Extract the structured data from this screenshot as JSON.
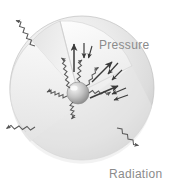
{
  "figure": {
    "name": "stellar-equilibrium-diagram",
    "width": 174,
    "height": 189,
    "background_color": "#ffffff"
  },
  "labels": {
    "pressure": "Pressure",
    "radiation": "Radiation",
    "text_color": "#8b8b8b"
  },
  "star": {
    "body_name": "star-sphere",
    "center": {
      "x": 82,
      "y": 88
    },
    "radius": 72,
    "surface_color_light": "#f2f2f2",
    "surface_color_mid": "#dcdcdc",
    "surface_color_dark": "#c8c8c8",
    "cutaway_name": "cutaway-wedge",
    "cutaway_color": "#fbfbfb",
    "core_name": "stellar-core",
    "core_center": {
      "x": 78,
      "y": 93
    },
    "core_radius": 11,
    "core_color_light": "#efefef",
    "core_color_dark": "#9a9a9a"
  },
  "photons": {
    "stroke_color": "#5a5a5a",
    "internal_count": 6,
    "escaping_count": 3,
    "escaping": [
      {
        "name": "escaping-photon-upper-left",
        "direction": "up-left"
      },
      {
        "name": "escaping-photon-lower-left",
        "direction": "down-left"
      },
      {
        "name": "escaping-photon-lower-right",
        "direction": "down-right"
      }
    ]
  },
  "arrows": {
    "stroke_color": "#3a3a3a",
    "pressure_outward_count": 3,
    "gravity_inward_count": 3,
    "description_up": "pressure-arrow-up",
    "description_upright": "pressure-arrow-up-right",
    "description_right": "pressure-arrow-right"
  }
}
